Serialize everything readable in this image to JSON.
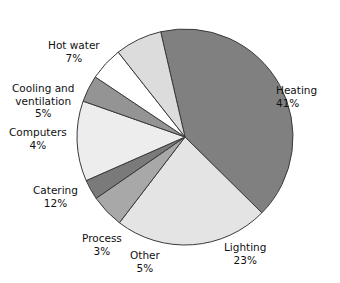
{
  "chart_data": {
    "type": "pie",
    "title": "",
    "subtitle": "",
    "xlabel": "",
    "ylabel": "",
    "legend_position": "none",
    "grid": false,
    "units": "%",
    "total": 100,
    "label_format": "name + value%",
    "categories": [
      "Heating",
      "Lighting",
      "Catering",
      "Hot water",
      "Cooling and ventilation",
      "Other",
      "Computers",
      "Process"
    ],
    "values": [
      41,
      23,
      12,
      7,
      5,
      5,
      4,
      3
    ],
    "slices": [
      {
        "label": "Heating",
        "value": 41,
        "value_text": "41%",
        "color": "#808080",
        "start_angle": -13.0,
        "sweep": 147.6
      },
      {
        "label": "Lighting",
        "value": 23,
        "value_text": "23%",
        "color": "#e4e4e4",
        "start_angle": 134.6,
        "sweep": 82.8
      },
      {
        "label": "Other",
        "value": 5,
        "value_text": "5%",
        "color": "#a8a8a8",
        "start_angle": 217.4,
        "sweep": 18.0
      },
      {
        "label": "Process",
        "value": 3,
        "value_text": "3%",
        "color": "#7a7a7a",
        "start_angle": 235.4,
        "sweep": 10.8
      },
      {
        "label": "Catering",
        "value": 12,
        "value_text": "12%",
        "color": "#ededed",
        "start_angle": 246.2,
        "sweep": 43.2
      },
      {
        "label": "Computers",
        "value": 4,
        "value_text": "4%",
        "color": "#949494",
        "start_angle": 289.4,
        "sweep": 14.4
      },
      {
        "label": "Cooling and ventilation",
        "value": 5,
        "value_text": "5%",
        "color": "#ffffff",
        "start_angle": 303.8,
        "sweep": 18.0
      },
      {
        "label": "Hot water",
        "value": 7,
        "value_text": "7%",
        "color": "#dcdcdc",
        "start_angle": 321.8,
        "sweep": 25.2
      }
    ]
  },
  "labels": {
    "heating": {
      "name": "Heating",
      "value": "41%"
    },
    "lighting": {
      "name": "Lighting",
      "value": "23%"
    },
    "other": {
      "name": "Other",
      "value": "5%"
    },
    "process": {
      "name": "Process",
      "value": "3%"
    },
    "catering": {
      "name": "Catering",
      "value": "12%"
    },
    "computers": {
      "name": "Computers",
      "value": "4%"
    },
    "cooling": {
      "name": "Cooling and",
      "name2": "ventilation",
      "value": "5%"
    },
    "hotwater": {
      "name": "Hot water",
      "value": "7%"
    }
  }
}
